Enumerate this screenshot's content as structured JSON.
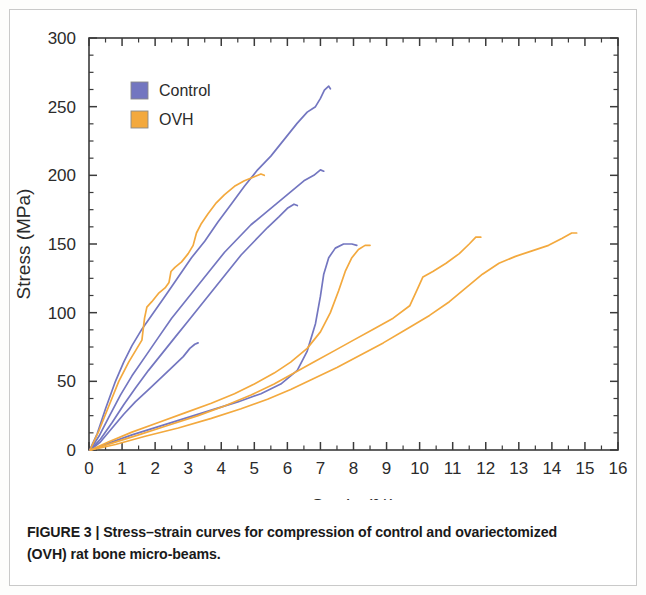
{
  "figure": {
    "caption_label": "FIGURE 3 |",
    "caption_text": " Stress–strain curves for compression of control and ovariectomized (OVH) rat bone micro-beams",
    "caption_tail": "."
  },
  "legend": {
    "position": "top-left-inside",
    "entries": [
      {
        "label": "Control",
        "color": "#7376c0"
      },
      {
        "label": "OVH",
        "color": "#f3a93e"
      }
    ]
  },
  "chart_data": {
    "type": "line",
    "title": "",
    "xlabel": "Strain (%)",
    "ylabel": "Stress (MPa)",
    "xlim": [
      0,
      16
    ],
    "ylim": [
      0,
      300
    ],
    "xticks": [
      0,
      1,
      2,
      3,
      4,
      5,
      6,
      7,
      8,
      9,
      10,
      11,
      12,
      13,
      14,
      15,
      16
    ],
    "yticks": [
      0,
      50,
      100,
      150,
      200,
      250,
      300
    ],
    "xtick_labels": [
      "0",
      "1",
      "2",
      "3",
      "4",
      "5",
      "6",
      "7",
      "8",
      "9",
      "10",
      "11",
      "12",
      "13",
      "14",
      "15",
      "16"
    ],
    "ytick_labels": [
      "0",
      "50",
      "100",
      "150",
      "200",
      "250",
      "300"
    ],
    "minor_tick_step_x": 0.5,
    "minor_tick_step_y": 12.5,
    "grid": false,
    "legend_position": "upper left",
    "series": [
      {
        "name": "Control 1",
        "group": "Control",
        "color": "#7376c0",
        "points": [
          [
            0.02,
            0
          ],
          [
            0.25,
            12
          ],
          [
            0.5,
            30
          ],
          [
            0.8,
            50
          ],
          [
            1.05,
            64
          ],
          [
            1.3,
            76
          ],
          [
            1.6,
            88
          ],
          [
            1.95,
            100
          ],
          [
            2.3,
            112
          ],
          [
            2.7,
            126
          ],
          [
            3.1,
            140
          ],
          [
            3.5,
            152
          ],
          [
            3.9,
            166
          ],
          [
            4.3,
            179
          ],
          [
            4.7,
            192
          ],
          [
            5.1,
            204
          ],
          [
            5.5,
            214
          ],
          [
            5.9,
            226
          ],
          [
            6.3,
            238
          ],
          [
            6.6,
            246
          ],
          [
            6.85,
            250
          ],
          [
            7.0,
            256
          ],
          [
            7.12,
            262
          ],
          [
            7.25,
            265
          ],
          [
            7.3,
            263
          ]
        ]
      },
      {
        "name": "Control 2",
        "group": "Control",
        "color": "#7376c0",
        "points": [
          [
            0.03,
            0
          ],
          [
            0.3,
            10
          ],
          [
            0.6,
            24
          ],
          [
            0.95,
            40
          ],
          [
            1.3,
            54
          ],
          [
            1.7,
            68
          ],
          [
            2.1,
            82
          ],
          [
            2.5,
            96
          ],
          [
            2.9,
            108
          ],
          [
            3.3,
            120
          ],
          [
            3.7,
            132
          ],
          [
            4.1,
            144
          ],
          [
            4.5,
            154
          ],
          [
            4.9,
            164
          ],
          [
            5.3,
            172
          ],
          [
            5.7,
            180
          ],
          [
            6.1,
            188
          ],
          [
            6.5,
            196
          ],
          [
            6.8,
            200
          ],
          [
            7.0,
            204
          ],
          [
            7.1,
            203
          ]
        ]
      },
      {
        "name": "Control 3",
        "group": "Control",
        "color": "#7376c0",
        "points": [
          [
            0.03,
            0
          ],
          [
            0.35,
            8
          ],
          [
            0.7,
            20
          ],
          [
            1.05,
            33
          ],
          [
            1.4,
            45
          ],
          [
            1.8,
            58
          ],
          [
            2.2,
            70
          ],
          [
            2.6,
            82
          ],
          [
            3.0,
            94
          ],
          [
            3.4,
            106
          ],
          [
            3.8,
            118
          ],
          [
            4.2,
            130
          ],
          [
            4.6,
            142
          ],
          [
            5.0,
            152
          ],
          [
            5.4,
            162
          ],
          [
            5.75,
            170
          ],
          [
            6.0,
            176
          ],
          [
            6.2,
            179
          ],
          [
            6.3,
            178
          ]
        ]
      },
      {
        "name": "Control 4",
        "group": "Control",
        "color": "#7376c0",
        "points": [
          [
            0.04,
            0
          ],
          [
            0.35,
            6
          ],
          [
            0.7,
            16
          ],
          [
            1.05,
            26
          ],
          [
            1.4,
            35
          ],
          [
            1.8,
            44
          ],
          [
            2.2,
            53
          ],
          [
            2.55,
            61
          ],
          [
            2.85,
            68
          ],
          [
            3.05,
            74
          ],
          [
            3.2,
            77
          ],
          [
            3.3,
            78
          ]
        ]
      },
      {
        "name": "Control 5",
        "group": "Control",
        "color": "#7376c0",
        "points": [
          [
            0.05,
            0
          ],
          [
            0.6,
            5
          ],
          [
            1.3,
            11
          ],
          [
            2.1,
            17
          ],
          [
            2.9,
            23
          ],
          [
            3.7,
            29
          ],
          [
            4.5,
            35
          ],
          [
            5.2,
            41
          ],
          [
            5.8,
            48
          ],
          [
            6.3,
            58
          ],
          [
            6.6,
            72
          ],
          [
            6.85,
            92
          ],
          [
            7.0,
            112
          ],
          [
            7.1,
            128
          ],
          [
            7.25,
            140
          ],
          [
            7.45,
            147
          ],
          [
            7.7,
            150
          ],
          [
            7.95,
            150
          ],
          [
            8.1,
            149
          ]
        ]
      },
      {
        "name": "OVH 1",
        "group": "OVH",
        "color": "#f3a93e",
        "points": [
          [
            0.03,
            0
          ],
          [
            0.3,
            14
          ],
          [
            0.6,
            32
          ],
          [
            0.9,
            50
          ],
          [
            1.2,
            64
          ],
          [
            1.45,
            74
          ],
          [
            1.6,
            80
          ],
          [
            1.68,
            96
          ],
          [
            1.75,
            104
          ],
          [
            1.9,
            108
          ],
          [
            2.1,
            114
          ],
          [
            2.3,
            118
          ],
          [
            2.42,
            122
          ],
          [
            2.48,
            130
          ],
          [
            2.6,
            133
          ],
          [
            2.8,
            137
          ],
          [
            3.0,
            143
          ],
          [
            3.15,
            149
          ],
          [
            3.25,
            158
          ],
          [
            3.4,
            165
          ],
          [
            3.6,
            172
          ],
          [
            3.85,
            180
          ],
          [
            4.1,
            186
          ],
          [
            4.4,
            192
          ],
          [
            4.7,
            196
          ],
          [
            5.0,
            199
          ],
          [
            5.2,
            201
          ],
          [
            5.3,
            200
          ]
        ]
      },
      {
        "name": "OVH 2",
        "group": "OVH",
        "color": "#f3a93e",
        "points": [
          [
            0.05,
            0
          ],
          [
            0.6,
            6
          ],
          [
            1.3,
            13
          ],
          [
            2.1,
            20
          ],
          [
            2.9,
            27
          ],
          [
            3.7,
            34
          ],
          [
            4.4,
            41
          ],
          [
            5.0,
            48
          ],
          [
            5.6,
            56
          ],
          [
            6.1,
            64
          ],
          [
            6.6,
            74
          ],
          [
            7.0,
            86
          ],
          [
            7.3,
            100
          ],
          [
            7.55,
            116
          ],
          [
            7.75,
            130
          ],
          [
            7.95,
            140
          ],
          [
            8.15,
            146
          ],
          [
            8.35,
            149
          ],
          [
            8.5,
            149
          ]
        ]
      },
      {
        "name": "OVH 3",
        "group": "OVH",
        "color": "#f3a93e",
        "points": [
          [
            0.05,
            0
          ],
          [
            0.7,
            5
          ],
          [
            1.5,
            11
          ],
          [
            2.4,
            18
          ],
          [
            3.3,
            25
          ],
          [
            4.1,
            32
          ],
          [
            4.9,
            40
          ],
          [
            5.6,
            48
          ],
          [
            6.2,
            56
          ],
          [
            6.8,
            64
          ],
          [
            7.4,
            72
          ],
          [
            8.0,
            80
          ],
          [
            8.6,
            88
          ],
          [
            9.2,
            96
          ],
          [
            9.7,
            105
          ],
          [
            9.95,
            118
          ],
          [
            10.1,
            126
          ],
          [
            10.4,
            130
          ],
          [
            10.8,
            136
          ],
          [
            11.2,
            143
          ],
          [
            11.5,
            150
          ],
          [
            11.7,
            155
          ],
          [
            11.85,
            155
          ]
        ]
      },
      {
        "name": "OVH 4",
        "group": "OVH",
        "color": "#f3a93e",
        "points": [
          [
            0.06,
            0
          ],
          [
            0.8,
            4
          ],
          [
            1.7,
            10
          ],
          [
            2.7,
            16
          ],
          [
            3.7,
            23
          ],
          [
            4.6,
            30
          ],
          [
            5.4,
            37
          ],
          [
            6.1,
            44
          ],
          [
            6.8,
            52
          ],
          [
            7.5,
            60
          ],
          [
            8.2,
            69
          ],
          [
            8.9,
            78
          ],
          [
            9.6,
            88
          ],
          [
            10.3,
            98
          ],
          [
            10.9,
            108
          ],
          [
            11.4,
            118
          ],
          [
            11.9,
            128
          ],
          [
            12.4,
            136
          ],
          [
            12.9,
            141
          ],
          [
            13.4,
            145
          ],
          [
            13.9,
            149
          ],
          [
            14.3,
            154
          ],
          [
            14.6,
            158
          ],
          [
            14.75,
            158
          ]
        ]
      }
    ]
  }
}
